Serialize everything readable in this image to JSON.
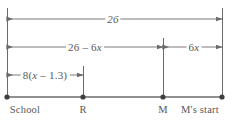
{
  "diagram": {
    "kind": "number-line-diagram",
    "colors": {
      "stroke": "#6b6b6d",
      "baseline": "#6b6b6d",
      "point": "#3f3f41",
      "text": "#58585a",
      "background": "#ffffff"
    },
    "baseline": {
      "y": 97,
      "x_start": 7,
      "x_end": 222
    },
    "points": [
      {
        "id": "school",
        "label": "School",
        "x": 7,
        "label_x": 25
      },
      {
        "id": "r",
        "label": "R",
        "x": 83,
        "label_x": 83
      },
      {
        "id": "m",
        "label": "M",
        "x": 163,
        "label_x": 163
      },
      {
        "id": "mstart",
        "label": "M's start",
        "x": 222,
        "label_x": 200
      }
    ],
    "point_label_y": 104,
    "verticals": [
      {
        "id": "left-edge",
        "x": 7,
        "y_top": 8,
        "y_bottom": 97
      },
      {
        "id": "r-tick",
        "x": 83,
        "y_top": 66,
        "y_bottom": 97
      },
      {
        "id": "m-tick",
        "x": 163,
        "y_top": 38,
        "y_bottom": 97
      },
      {
        "id": "right-edge",
        "x": 222,
        "y_top": 8,
        "y_bottom": 97
      }
    ],
    "measures": [
      {
        "id": "total",
        "text": "26",
        "text_pre": "26",
        "text_var": "",
        "text_post": "",
        "x_start": 7,
        "x_end": 222,
        "y": 19,
        "label_x": 113,
        "direction": "outward"
      },
      {
        "id": "school-to-m",
        "text": "26 – 6x",
        "text_pre": "26 – 6",
        "text_var": "x",
        "text_post": "",
        "x_start": 7,
        "x_end": 163,
        "y": 47,
        "label_x": 85,
        "direction": "outward"
      },
      {
        "id": "m-to-mstart",
        "text": "6x",
        "text_pre": "6",
        "text_var": "x",
        "text_post": "",
        "x_start": 163,
        "x_end": 222,
        "y": 47,
        "label_x": 194,
        "direction": "inward"
      },
      {
        "id": "school-to-r",
        "text": "8(x – 1.3)",
        "text_pre": "8(",
        "text_var": "x",
        "text_post": " – 1.3)",
        "x_start": 7,
        "x_end": 83,
        "y": 75,
        "label_x": 45,
        "direction": "inward"
      }
    ]
  }
}
